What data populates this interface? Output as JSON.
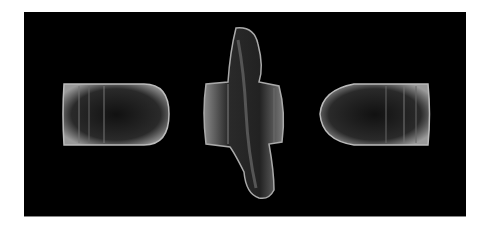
{
  "image": {
    "description": "Three lead bullets photographed on a black background: a side view of an intact bullet pointing right, a heavily deformed flattened bullet in the center, and a side view of an intact bullet pointing left.",
    "background_color": "#000000",
    "frame_color": "#ffffff",
    "objects": [
      {
        "name": "left-bullet",
        "orientation": "nose right"
      },
      {
        "name": "center-deformed-bullet",
        "orientation": "vertical, deformed"
      },
      {
        "name": "right-bullet",
        "orientation": "nose left"
      }
    ]
  }
}
